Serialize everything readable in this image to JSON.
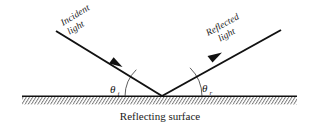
{
  "figure": {
    "type": "physics-diagram",
    "background_color": "#ffffff",
    "ink_color": "#111111",
    "hatch_color": "#5a5a5a",
    "labels": {
      "incident_line1": "Incident",
      "incident_line2": "light",
      "reflected_line1": "Reflected",
      "reflected_line2": "light",
      "angle_incidence_symbol": "θ",
      "angle_incidence_subscript": "i",
      "angle_reflection_symbol": "θ",
      "angle_reflection_subscript": "r",
      "caption": "Reflecting surface"
    },
    "geometry": {
      "vertex_x": 162,
      "vertex_y": 96,
      "incident_start_x": 56,
      "incident_start_y": 31,
      "reflected_end_x": 281,
      "reflected_end_y": 30,
      "surface_left_x": 22,
      "surface_right_x": 297,
      "surface_y": 96,
      "hatch_band_height": 8,
      "incident_arrow_x": 116,
      "incident_arrow_y": 63,
      "reflected_arrow_x": 215,
      "reflected_arrow_y": 57,
      "arc_incidence_radius": 37,
      "arc_reflection_radius": 40
    }
  }
}
